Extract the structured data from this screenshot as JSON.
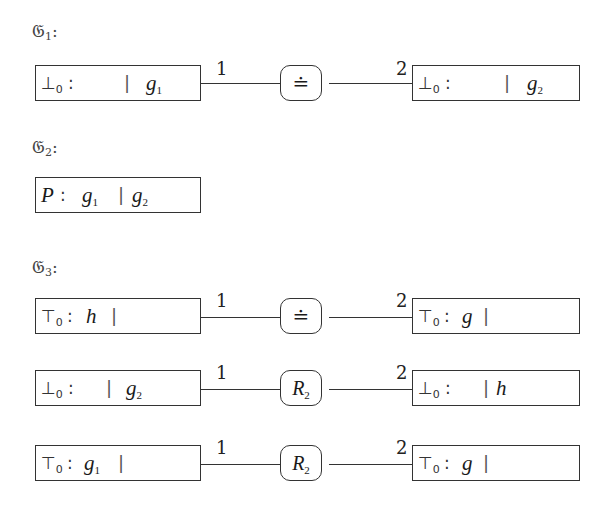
{
  "groups": [
    {
      "label": "𝔊",
      "index": "1",
      "colon": ":",
      "rows": [
        {
          "left": {
            "head": "⊥",
            "head_sub": "0",
            "colon": ":",
            "before_bar": "",
            "bar": "|",
            "after_var": "g",
            "after_sub": "1"
          },
          "node": {
            "symbol": "≐"
          },
          "port_left": "1",
          "port_right": "2",
          "right": {
            "head": "⊥",
            "head_sub": "0",
            "colon": ":",
            "before_bar": "",
            "bar": "|",
            "after_var": "g",
            "after_sub": "2"
          }
        }
      ]
    },
    {
      "label": "𝔊",
      "index": "2",
      "colon": ":",
      "rows": [
        {
          "left": {
            "head": "P",
            "colon": ":",
            "before_var": "g",
            "before_sub": "1",
            "bar": "|",
            "after_var": "g",
            "after_sub": "2"
          }
        }
      ]
    },
    {
      "label": "𝔊",
      "index": "3",
      "colon": ":",
      "rows": [
        {
          "left": {
            "head": "⊤",
            "head_sub": "0",
            "colon": ":",
            "before_var": "h",
            "bar": "|"
          },
          "node": {
            "symbol": "≐"
          },
          "port_left": "1",
          "port_right": "2",
          "right": {
            "head": "⊤",
            "head_sub": "0",
            "colon": ":",
            "before_var": "g",
            "bar": "|"
          }
        },
        {
          "left": {
            "head": "⊥",
            "head_sub": "0",
            "colon": ":",
            "bar": "|",
            "after_var": "g",
            "after_sub": "2"
          },
          "node": {
            "symbol": "R",
            "symbol_sub": "2"
          },
          "port_left": "1",
          "port_right": "2",
          "right": {
            "head": "⊥",
            "head_sub": "0",
            "colon": ":",
            "bar": "|",
            "after_var": "h"
          }
        },
        {
          "left": {
            "head": "⊤",
            "head_sub": "0",
            "colon": ":",
            "before_var": "g",
            "before_sub": "1",
            "bar": "|"
          },
          "node": {
            "symbol": "R",
            "symbol_sub": "2"
          },
          "port_left": "1",
          "port_right": "2",
          "right": {
            "head": "⊤",
            "head_sub": "0",
            "colon": ":",
            "before_var": "g",
            "bar": "|"
          }
        }
      ]
    }
  ]
}
